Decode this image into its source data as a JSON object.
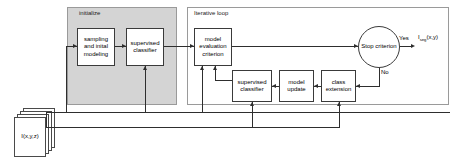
{
  "diagram": {
    "type": "flowchart",
    "canvas": {
      "width": 451,
      "height": 162
    },
    "colors": {
      "background": "#ffffff",
      "initialize_fill": "#d4d4d4",
      "iterative_fill": "#ffffff",
      "group_border": "#9a9a9a",
      "node_border": "#3a3a3a",
      "node_fill": "#ffffff",
      "line": "#2e2e2e",
      "text": "#000000"
    },
    "groups": [
      {
        "id": "initialize",
        "label": "initialize",
        "fill": "shaded"
      },
      {
        "id": "iterative_loop",
        "label": "Iterative loop",
        "fill": "plain"
      }
    ],
    "nodes": [
      {
        "id": "sampling",
        "label": "sampling and inital modeling",
        "lines": [
          "sampling",
          "and inital",
          "modeling"
        ],
        "group": "initialize",
        "shape": "rect"
      },
      {
        "id": "sup_classifier_init",
        "label": "supervised classifier",
        "lines": [
          "supervised",
          "classifier"
        ],
        "group": "initialize",
        "shape": "rect"
      },
      {
        "id": "model_eval",
        "label": "model evaluation criterion",
        "lines": [
          "model",
          "evaluation",
          "criterion"
        ],
        "group": "iterative_loop",
        "shape": "rect"
      },
      {
        "id": "sup_classifier_loop",
        "label": "supervised classifier",
        "lines": [
          "supervised",
          "classifier"
        ],
        "group": "iterative_loop",
        "shape": "rect"
      },
      {
        "id": "model_update",
        "label": "model update",
        "lines": [
          "model",
          "update"
        ],
        "group": "iterative_loop",
        "shape": "rect"
      },
      {
        "id": "class_extension",
        "label": "class extension",
        "lines": [
          "class",
          "extension"
        ],
        "group": "iterative_loop",
        "shape": "rect"
      },
      {
        "id": "stop_criterion",
        "label": "Stop criterion",
        "lines": [
          "Stop",
          "criterion"
        ],
        "group": "iterative_loop",
        "shape": "circle"
      }
    ],
    "input": {
      "id": "input_volume",
      "label": "I(x,y,z)",
      "shape": "document-stack",
      "sheets": 4
    },
    "output": {
      "id": "output_segmentation",
      "label_main": "I",
      "label_sub": "seg",
      "label_tail": "(x,y)"
    },
    "edge_labels": [
      {
        "id": "yes-label",
        "text": "Yes"
      },
      {
        "id": "no-label",
        "text": "No"
      }
    ]
  }
}
